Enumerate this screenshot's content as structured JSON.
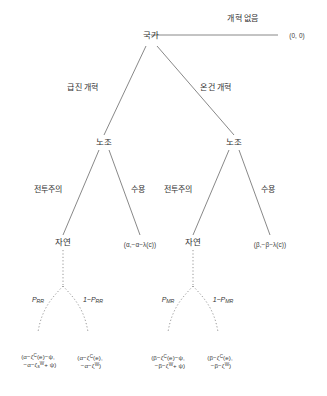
{
  "diagram": {
    "type": "extensive-form-game-tree",
    "nodes": {
      "root": "국가",
      "union_left": "노조",
      "union_right": "노조",
      "nature_left": "자연",
      "nature_right": "자연"
    },
    "edges": {
      "no_reform": "개혁 없음",
      "radical_reform": "급진 개혁",
      "moderate_reform": "온건 개혁",
      "militancy_left": "전투주의",
      "accommodation_left": "수용",
      "militancy_right": "전투주의",
      "accommodation_right": "수용"
    },
    "probabilities": {
      "left_high": {
        "base": "P",
        "sub": "RR"
      },
      "left_low": {
        "base": "1−P",
        "sub": "RR"
      },
      "right_high": {
        "base": "P",
        "sub": "MR"
      },
      "right_low": {
        "base": "1−P",
        "sub": "MR"
      }
    },
    "payoffs": {
      "no_reform": "(0, 0)",
      "accommodation_left": "(α,−α−λ(c))",
      "accommodation_right": "(β,−β−λ(c))",
      "rr_success_line1": "(α−ζ",
      "rr_success_line1_sup": "C",
      "rr_success_line1_tail": "(e)−ψ,",
      "rr_success_line2": "−α−ζ",
      "rr_success_line2_sub": "s",
      "rr_success_line2_sup": "W",
      "rr_success_line2_tail": "+ ψ)",
      "rr_fail_line1": "(α−ζ",
      "rr_fail_line1_sup": "C",
      "rr_fail_line1_tail": "(e),",
      "rr_fail_line2": "−α−ζ",
      "rr_fail_line2_sup": "W",
      "rr_fail_line2_tail": ")",
      "mr_success_line1": "(β−ζ",
      "mr_success_line1_sup": "C",
      "mr_success_line1_tail": "(e)−ψ,",
      "mr_success_line2": "−β−ζ",
      "mr_success_line2_sup": "W",
      "mr_success_line2_tail": "+ ψ)",
      "mr_fail_line1": "(β−ζ",
      "mr_fail_line1_sup": "C",
      "mr_fail_line1_tail": "(e),",
      "mr_fail_line2": "−β−ζ",
      "mr_fail_line2_sup": "W",
      "mr_fail_line2_tail": ")"
    },
    "colors": {
      "line": "#7b7b7b",
      "text": "#333333",
      "background": "#ffffff"
    }
  }
}
